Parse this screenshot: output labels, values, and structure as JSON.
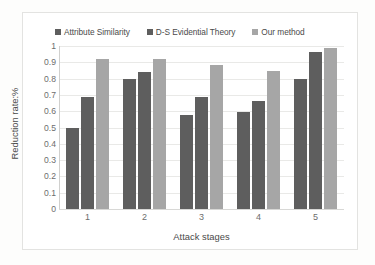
{
  "chart_data": {
    "type": "bar",
    "title": "",
    "subtitle": "",
    "xlabel": "Attack stages",
    "ylabel": "Reduction rate:%",
    "categories": [
      "1",
      "2",
      "3",
      "4",
      "5"
    ],
    "series": [
      {
        "name": "Attribute Similarity",
        "color": "#5e5e5e",
        "values": [
          0.5,
          0.8,
          0.575,
          0.595,
          0.8
        ]
      },
      {
        "name": "D-S Evidential Theory",
        "color": "#5e5e5e",
        "values": [
          0.685,
          0.84,
          0.685,
          0.66,
          0.965
        ]
      },
      {
        "name": "Our method",
        "color": "#a6a6a6",
        "values": [
          0.92,
          0.92,
          0.885,
          0.845,
          0.99
        ]
      }
    ],
    "ylim": [
      0,
      1
    ],
    "ytick_labels": [
      "1",
      "0.9",
      "0.8",
      "0.7",
      "0.6",
      "0.5",
      "0.4",
      "0.3",
      "0.2",
      "0.1",
      "0"
    ],
    "ytick_values": [
      1,
      0.9,
      0.8,
      0.7,
      0.6,
      0.5,
      0.4,
      0.3,
      0.2,
      0.1,
      0
    ],
    "grid": true,
    "grid_axis": "y",
    "legend_position": "top"
  },
  "colors": {
    "series_1": "#5e5e5e",
    "series_2": "#5e5e5e",
    "series_3": "#a6a6a6",
    "gridline": "#e9e9e7",
    "axis_text": "#6d6d6d",
    "title_text": "#4a4a4a",
    "plot_background": "#ffffff",
    "frame_border": "#e3e3e1"
  }
}
